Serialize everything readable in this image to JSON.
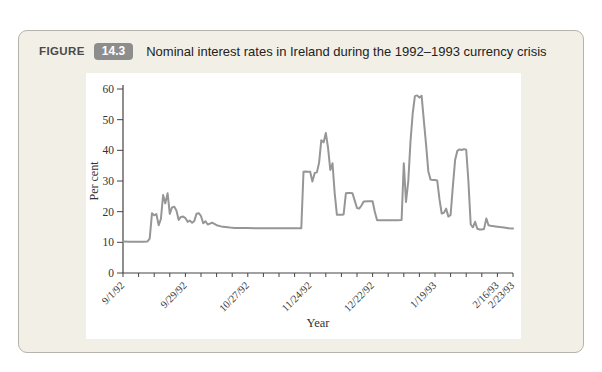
{
  "figure": {
    "label": "FIGURE",
    "number": "14.3",
    "title": "Nominal interest rates in Ireland during the 1992–1993 currency crisis"
  },
  "colors": {
    "panel_bg": "#f2efe6",
    "panel_border": "#b5b3aa",
    "badge_bg": "#8d8d8d",
    "line": "#969696",
    "axis": "#444444"
  },
  "chart_data": {
    "type": "line",
    "series_name": "Nominal interest rate",
    "xlabel": "Year",
    "ylabel": "Per cent",
    "ylim": [
      0,
      60
    ],
    "y_ticks": [
      0,
      10,
      20,
      30,
      40,
      50,
      60
    ],
    "x_start_day": 0,
    "x_end_day": 175,
    "x_minor_tick_every_days": 7,
    "x_ticks": [
      {
        "day": 0,
        "label": "9/1/92"
      },
      {
        "day": 28,
        "label": "9/29/92"
      },
      {
        "day": 56,
        "label": "10/27/92"
      },
      {
        "day": 84,
        "label": "11/24/92"
      },
      {
        "day": 112,
        "label": "12/22/92"
      },
      {
        "day": 140,
        "label": "1/19/93"
      },
      {
        "day": 168,
        "label": "2/16/93"
      },
      {
        "day": 175,
        "label": "2/23/93"
      }
    ],
    "grid": false,
    "legend": "none",
    "points": [
      [
        0,
        10.3
      ],
      [
        3,
        10.2
      ],
      [
        6,
        10.2
      ],
      [
        9,
        10.2
      ],
      [
        11,
        10.3
      ],
      [
        12,
        11.2
      ],
      [
        13,
        19.5
      ],
      [
        14,
        18.8
      ],
      [
        15,
        19.2
      ],
      [
        16,
        15.6
      ],
      [
        17,
        17.6
      ],
      [
        18,
        25.4
      ],
      [
        19,
        22.7
      ],
      [
        20,
        26.0
      ],
      [
        21,
        19.3
      ],
      [
        22,
        21.4
      ],
      [
        23,
        21.6
      ],
      [
        24,
        20.3
      ],
      [
        25,
        17.3
      ],
      [
        26,
        18.3
      ],
      [
        27,
        18.4
      ],
      [
        28,
        17.9
      ],
      [
        29,
        16.7
      ],
      [
        30,
        17.1
      ],
      [
        31,
        16.4
      ],
      [
        32,
        17.0
      ],
      [
        33,
        19.3
      ],
      [
        34,
        19.5
      ],
      [
        35,
        18.6
      ],
      [
        36,
        16.2
      ],
      [
        37,
        16.9
      ],
      [
        38,
        15.8
      ],
      [
        39,
        16.1
      ],
      [
        40,
        16.4
      ],
      [
        42,
        15.6
      ],
      [
        44,
        15.2
      ],
      [
        46,
        15.0
      ],
      [
        48,
        14.8
      ],
      [
        50,
        14.7
      ],
      [
        55,
        14.7
      ],
      [
        60,
        14.6
      ],
      [
        65,
        14.6
      ],
      [
        70,
        14.6
      ],
      [
        75,
        14.6
      ],
      [
        80,
        14.6
      ],
      [
        81,
        33.0
      ],
      [
        82,
        33.1
      ],
      [
        83,
        33.0
      ],
      [
        84,
        33.0
      ],
      [
        85,
        29.8
      ],
      [
        86,
        32.6
      ],
      [
        87,
        32.8
      ],
      [
        88,
        36.0
      ],
      [
        89,
        43.3
      ],
      [
        90,
        42.6
      ],
      [
        91,
        45.7
      ],
      [
        92,
        41.0
      ],
      [
        93,
        33.6
      ],
      [
        94,
        35.8
      ],
      [
        95,
        26.0
      ],
      [
        96,
        19.0
      ],
      [
        98,
        19.0
      ],
      [
        99,
        19.1
      ],
      [
        100,
        26.0
      ],
      [
        101,
        26.1
      ],
      [
        102,
        26.1
      ],
      [
        103,
        26.0
      ],
      [
        104,
        23.5
      ],
      [
        105,
        21.2
      ],
      [
        106,
        21.0
      ],
      [
        107,
        22.0
      ],
      [
        108,
        23.3
      ],
      [
        110,
        23.4
      ],
      [
        112,
        23.4
      ],
      [
        113,
        20.0
      ],
      [
        114,
        17.2
      ],
      [
        117,
        17.2
      ],
      [
        120,
        17.2
      ],
      [
        123,
        17.2
      ],
      [
        125,
        17.3
      ],
      [
        126,
        35.8
      ],
      [
        127,
        23.2
      ],
      [
        128,
        30.0
      ],
      [
        129,
        43.0
      ],
      [
        130,
        52.0
      ],
      [
        131,
        57.7
      ],
      [
        132,
        57.9
      ],
      [
        133,
        57.2
      ],
      [
        134,
        57.8
      ],
      [
        135,
        49.5
      ],
      [
        136,
        41.8
      ],
      [
        137,
        33.2
      ],
      [
        138,
        30.5
      ],
      [
        139,
        30.3
      ],
      [
        140,
        30.3
      ],
      [
        141,
        30.2
      ],
      [
        142,
        24.0
      ],
      [
        143,
        19.4
      ],
      [
        144,
        19.6
      ],
      [
        145,
        21.0
      ],
      [
        146,
        18.4
      ],
      [
        147,
        18.9
      ],
      [
        148,
        28.0
      ],
      [
        149,
        36.8
      ],
      [
        150,
        39.8
      ],
      [
        151,
        40.3
      ],
      [
        152,
        40.1
      ],
      [
        153,
        40.4
      ],
      [
        154,
        40.2
      ],
      [
        155,
        30.0
      ],
      [
        156,
        15.8
      ],
      [
        157,
        14.9
      ],
      [
        158,
        16.7
      ],
      [
        159,
        14.4
      ],
      [
        160,
        14.2
      ],
      [
        161,
        14.2
      ],
      [
        162,
        14.3
      ],
      [
        163,
        17.8
      ],
      [
        164,
        15.6
      ],
      [
        165,
        15.4
      ],
      [
        166,
        15.3
      ],
      [
        167,
        15.2
      ],
      [
        169,
        15.0
      ],
      [
        171,
        14.8
      ],
      [
        173,
        14.6
      ],
      [
        175,
        14.5
      ]
    ]
  }
}
